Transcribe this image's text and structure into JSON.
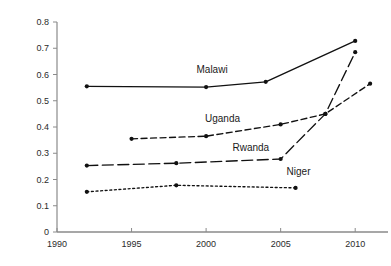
{
  "chart_data": {
    "type": "line",
    "title": "",
    "xlabel": "",
    "ylabel": "",
    "xlim": [
      1990,
      2012.2
    ],
    "ylim": [
      0,
      0.8
    ],
    "grid": false,
    "legend": "inline-series-labels",
    "xticks": [
      1990,
      1995,
      2000,
      2005,
      2010
    ],
    "xtick_labels": [
      "1990",
      "1995",
      "2000",
      "2005",
      "2010"
    ],
    "yticks": [
      0,
      0.1,
      0.2,
      0.3,
      0.4,
      0.5,
      0.6,
      0.7,
      0.8
    ],
    "ytick_labels": [
      "0",
      "0.1",
      "0.2",
      "0.3",
      "0.4",
      "0.5",
      "0.6",
      "0.7",
      "0.8"
    ],
    "series": [
      {
        "name": "Malawi",
        "dash": "solid",
        "x": [
          1992,
          2000,
          2004,
          2010
        ],
        "values": [
          0.555,
          0.552,
          0.572,
          0.728
        ],
        "label_x": 2000.4,
        "label_y": 0.605
      },
      {
        "name": "Uganda",
        "dash": "dashed",
        "x": [
          1995,
          2000,
          2005,
          2008,
          2011
        ],
        "values": [
          0.355,
          0.365,
          0.41,
          0.45,
          0.565
        ],
        "label_x": 2001.1,
        "label_y": 0.418
      },
      {
        "name": "Rwanda",
        "dash": "long-dash",
        "x": [
          1992,
          1998,
          2005,
          2008,
          2010
        ],
        "values": [
          0.253,
          0.262,
          0.278,
          0.45,
          0.685
        ],
        "label_x": 2003.0,
        "label_y": 0.308
      },
      {
        "name": "Niger",
        "dash": "dotted",
        "x": [
          1992,
          1998,
          2006
        ],
        "values": [
          0.153,
          0.178,
          0.168
        ],
        "label_x": 2006.2,
        "label_y": 0.218
      }
    ]
  },
  "axis": {
    "y_label_0": "0",
    "y_label_1": "0.1",
    "y_label_2": "0.2",
    "y_label_3": "0.3",
    "y_label_4": "0.4",
    "y_label_5": "0.5",
    "y_label_6": "0.6",
    "y_label_7": "0.7",
    "y_label_8": "0.8",
    "x_label_0": "1990",
    "x_label_1": "1995",
    "x_label_2": "2000",
    "x_label_3": "2005",
    "x_label_4": "2010"
  },
  "series_labels": {
    "malawi": "Malawi",
    "uganda": "Uganda",
    "rwanda": "Rwanda",
    "niger": "Niger"
  },
  "colors": {
    "line": "#111111",
    "axis": "#8a8a8a",
    "text": "#2b2b2b"
  }
}
